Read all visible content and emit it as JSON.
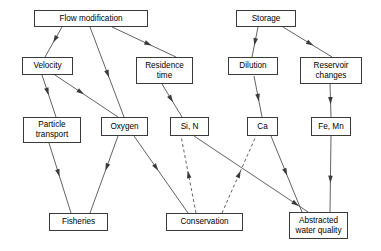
{
  "diagram": {
    "width": 381,
    "height": 251,
    "background": "#ffffff",
    "line_color": "#3a3a3a",
    "text_color": "#000000",
    "nodes": [
      {
        "id": "flow_modification",
        "label": "Flow modification",
        "x": 34,
        "y": 10,
        "w": 114,
        "h": 17
      },
      {
        "id": "storage",
        "label": "Storage",
        "x": 236,
        "y": 10,
        "w": 60,
        "h": 17
      },
      {
        "id": "velocity",
        "label": "Velocity",
        "x": 22,
        "y": 57,
        "w": 51,
        "h": 18
      },
      {
        "id": "residence_time",
        "label": "Residence\ntime",
        "x": 136,
        "y": 57,
        "w": 57,
        "h": 27
      },
      {
        "id": "dilution",
        "label": "Dilution",
        "x": 228,
        "y": 57,
        "w": 50,
        "h": 18
      },
      {
        "id": "reservoir_changes",
        "label": "Reservoir\nchanges",
        "x": 300,
        "y": 57,
        "w": 62,
        "h": 27
      },
      {
        "id": "particle_transport",
        "label": "Particle\ntransport",
        "x": 23,
        "y": 117,
        "w": 58,
        "h": 26
      },
      {
        "id": "oxygen",
        "label": "Oxygen",
        "x": 101,
        "y": 117,
        "w": 47,
        "h": 19
      },
      {
        "id": "si_n",
        "label": "Si, N",
        "x": 170,
        "y": 117,
        "w": 39,
        "h": 19
      },
      {
        "id": "ca",
        "label": "Ca",
        "x": 247,
        "y": 117,
        "w": 31,
        "h": 19
      },
      {
        "id": "fe_mn",
        "label": "Fe, Mn",
        "x": 311,
        "y": 117,
        "w": 40,
        "h": 19
      },
      {
        "id": "fisheries",
        "label": "Fisheries",
        "x": 49,
        "y": 213,
        "w": 59,
        "h": 18
      },
      {
        "id": "conservation",
        "label": "Conservation",
        "x": 166,
        "y": 213,
        "w": 77,
        "h": 18
      },
      {
        "id": "abstracted_water_quality",
        "label": "Abstracted\nwater quality",
        "x": 289,
        "y": 212,
        "w": 59,
        "h": 27
      }
    ],
    "edges": [
      {
        "id": "flow-to-velocity",
        "from": "flow_modification",
        "to": "velocity",
        "style": "solid",
        "x1": 62,
        "y1": 27,
        "x2": 45,
        "y2": 57,
        "arrow_t": 0.52
      },
      {
        "id": "flow-to-oxygen",
        "from": "flow_modification",
        "to": "oxygen",
        "style": "solid",
        "x1": 90,
        "y1": 27,
        "x2": 124,
        "y2": 117,
        "arrow_t": 0.56
      },
      {
        "id": "flow-to-residence-time",
        "from": "flow_modification",
        "to": "residence_time",
        "style": "solid",
        "x1": 112,
        "y1": 27,
        "x2": 176,
        "y2": 57,
        "arrow_t": 0.62
      },
      {
        "id": "velocity-to-particle-transport",
        "from": "velocity",
        "to": "particle_transport",
        "style": "solid",
        "x1": 42,
        "y1": 75,
        "x2": 56,
        "y2": 117,
        "arrow_t": 0.48
      },
      {
        "id": "velocity-to-oxygen",
        "from": "velocity",
        "to": "oxygen",
        "style": "solid",
        "x1": 55,
        "y1": 75,
        "x2": 118,
        "y2": 117,
        "arrow_t": 0.46
      },
      {
        "id": "residence-time-to-si-n",
        "from": "residence_time",
        "to": "si_n",
        "style": "solid",
        "x1": 162,
        "y1": 84,
        "x2": 182,
        "y2": 117,
        "arrow_t": 0.55
      },
      {
        "id": "storage-to-dilution",
        "from": "storage",
        "to": "dilution",
        "style": "solid",
        "x1": 258,
        "y1": 27,
        "x2": 252,
        "y2": 57,
        "arrow_t": 0.62
      },
      {
        "id": "storage-to-reservoir-changes",
        "from": "storage",
        "to": "reservoir_changes",
        "style": "solid",
        "x1": 283,
        "y1": 27,
        "x2": 332,
        "y2": 57,
        "arrow_t": 0.62
      },
      {
        "id": "dilution-to-ca",
        "from": "dilution",
        "to": "ca",
        "style": "solid",
        "x1": 254,
        "y1": 76,
        "x2": 262,
        "y2": 117,
        "arrow_t": 0.62
      },
      {
        "id": "reservoir-changes-to-fe-mn",
        "from": "reservoir_changes",
        "to": "fe_mn",
        "style": "solid",
        "x1": 330,
        "y1": 84,
        "x2": 331,
        "y2": 117,
        "arrow_t": 0.62
      },
      {
        "id": "particle-transport-to-fisheries",
        "from": "particle_transport",
        "to": "fisheries",
        "style": "solid",
        "x1": 49,
        "y1": 143,
        "x2": 71,
        "y2": 213,
        "arrow_t": 0.48
      },
      {
        "id": "oxygen-to-fisheries",
        "from": "oxygen",
        "to": "fisheries",
        "style": "solid",
        "x1": 118,
        "y1": 136,
        "x2": 90,
        "y2": 213,
        "arrow_t": 0.45
      },
      {
        "id": "oxygen-to-conservation",
        "from": "oxygen",
        "to": "conservation",
        "style": "solid",
        "x1": 134,
        "y1": 136,
        "x2": 188,
        "y2": 213,
        "arrow_t": 0.45
      },
      {
        "id": "si-n-to-abstracted-water-quality",
        "from": "si_n",
        "to": "abstracted_water_quality",
        "style": "solid",
        "x1": 194,
        "y1": 136,
        "x2": 308,
        "y2": 212,
        "arrow_t": 0.92
      },
      {
        "id": "conservation-to-si-n",
        "from": "conservation",
        "to": "si_n",
        "style": "dashed",
        "x1": 196,
        "y1": 213,
        "x2": 181,
        "y2": 136,
        "arrow_t": 0.55
      },
      {
        "id": "conservation-to-ca",
        "from": "conservation",
        "to": "ca",
        "style": "dashed",
        "x1": 222,
        "y1": 213,
        "x2": 256,
        "y2": 136,
        "arrow_t": 0.55
      },
      {
        "id": "ca-to-abstracted-water-quality",
        "from": "ca",
        "to": "abstracted_water_quality",
        "style": "solid",
        "x1": 271,
        "y1": 136,
        "x2": 302,
        "y2": 212,
        "arrow_t": 0.52
      },
      {
        "id": "fe-mn-to-abstracted-water-quality",
        "from": "fe_mn",
        "to": "abstracted_water_quality",
        "style": "solid",
        "x1": 331,
        "y1": 136,
        "x2": 330,
        "y2": 212,
        "arrow_t": 0.62
      }
    ]
  }
}
